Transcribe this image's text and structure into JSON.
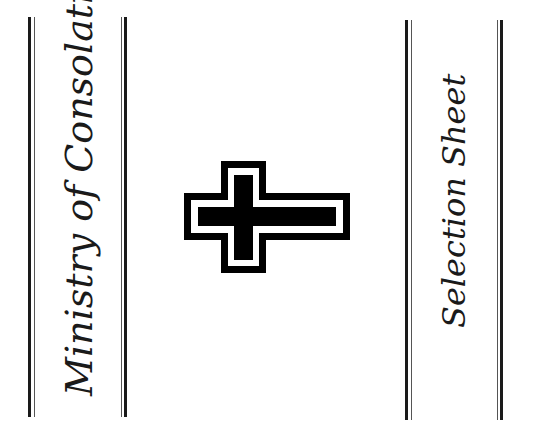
{
  "left_panel": {
    "title": "Ministry of Consolation"
  },
  "right_panel": {
    "title": "Selection Sheet"
  },
  "emblem": {
    "icon": "double-outlined-cross-icon",
    "color": "#000000"
  },
  "colors": {
    "ink": "#1a1a1a",
    "background": "#ffffff"
  }
}
